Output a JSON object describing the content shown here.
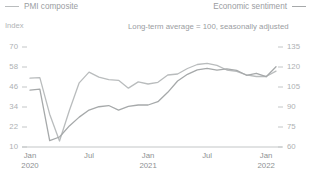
{
  "legend": {
    "left": {
      "label": "PMI composite",
      "color": "#b9bcbd",
      "swatch_icon": "line-swatch"
    },
    "right": {
      "label": "Economic sentiment",
      "color": "#a6a9aa",
      "swatch_icon": "line-swatch"
    }
  },
  "axis_unit_label": "Index",
  "subtitle": "Long-term average = 100, seasonally adjusted",
  "chart_data": {
    "type": "line",
    "title": "",
    "subtitle": "Long-term average = 100, seasonally adjusted",
    "xlabel": "",
    "ylabel": "Index",
    "grid": false,
    "legend_position": "top",
    "x_tick_labels": [
      "Jan",
      "Jul",
      "Jan",
      "Jul",
      "Jan"
    ],
    "x_tick_sublabels": [
      "2020",
      "",
      "2021",
      "",
      "2022"
    ],
    "x_tick_positions": [
      0,
      6,
      12,
      18,
      24
    ],
    "xlim": [
      0,
      25
    ],
    "left_axis": {
      "name": "Index",
      "ticks": [
        10,
        22,
        34,
        46,
        58,
        70
      ],
      "ylim": [
        10,
        76
      ]
    },
    "right_axis": {
      "name": "Economic sentiment index",
      "ticks": [
        60,
        75,
        90,
        105,
        120,
        135
      ],
      "ylim": [
        60,
        142.5
      ]
    },
    "series": [
      {
        "name": "PMI composite",
        "axis": "left",
        "color": "#b9bcbd",
        "x": [
          0,
          1,
          2,
          3,
          4,
          5,
          6,
          7,
          8,
          9,
          10,
          11,
          12,
          13,
          14,
          15,
          16,
          17,
          18,
          19,
          20,
          21,
          22,
          23,
          24,
          25
        ],
        "values": [
          51.3,
          51.6,
          29.7,
          13.6,
          31.9,
          48.5,
          54.9,
          51.9,
          50.4,
          50.0,
          45.3,
          49.1,
          47.8,
          48.8,
          53.2,
          53.8,
          57.1,
          59.5,
          60.2,
          59.0,
          56.2,
          55.4,
          53.3,
          52.3,
          52.3,
          55.5
        ]
      },
      {
        "name": "Economic sentiment",
        "axis": "right",
        "color": "#a6a9aa",
        "x": [
          0,
          1,
          2,
          3,
          4,
          5,
          6,
          7,
          8,
          9,
          10,
          11,
          12,
          13,
          14,
          15,
          16,
          17,
          18,
          19,
          20,
          21,
          22,
          23,
          24,
          25
        ],
        "values": [
          102.6,
          103.4,
          64.8,
          67.5,
          75.8,
          82.4,
          87.7,
          90.2,
          91.1,
          87.7,
          90.4,
          91.5,
          91.5,
          94.0,
          101.0,
          109.5,
          114.5,
          117.9,
          119.0,
          117.6,
          118.6,
          117.5,
          113.8,
          115.3,
          112.7,
          120.2
        ]
      }
    ]
  }
}
